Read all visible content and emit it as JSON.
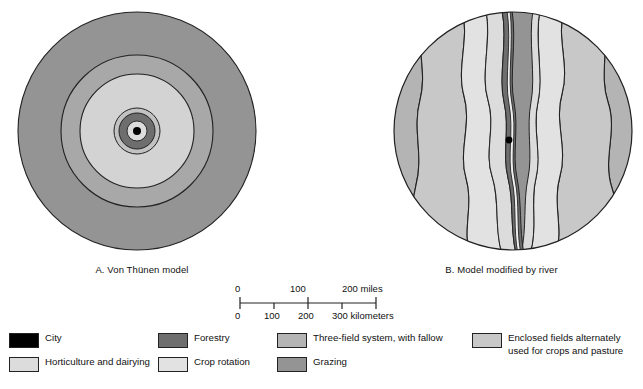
{
  "figure": {
    "panels": [
      {
        "id": "panel-a",
        "caption": "A. Von Thünen model",
        "type": "concentric-rings",
        "center": {
          "x": 137,
          "y": 131
        },
        "rings": [
          {
            "zone": "Grazing",
            "outer_r": 119,
            "color": "#949494"
          },
          {
            "zone": "Three-field system, with fallow",
            "outer_r": 76,
            "color": "#a8a8a8"
          },
          {
            "zone": "Crop rotation",
            "outer_r": 57,
            "color": "#d3d3d3"
          },
          {
            "zone": "Enclosed fields alternately used for crops and pasture",
            "outer_r": 23,
            "color": "#c2c2c2"
          },
          {
            "zone": "Forestry",
            "outer_r": 18,
            "color": "#6e6e6e"
          },
          {
            "zone": "Horticulture and dairying",
            "outer_r": 10,
            "color": "#dcdcdc"
          },
          {
            "zone": "City",
            "outer_r": 4,
            "color": "#000000"
          }
        ]
      },
      {
        "id": "panel-b",
        "caption": "B. Model modified by river",
        "type": "river-modified-bands",
        "center": {
          "x": 513,
          "y": 131
        },
        "radius": 119,
        "city_marker": {
          "x": 509,
          "y": 140,
          "r": 3.4,
          "color": "#000000"
        }
      }
    ]
  },
  "scalebar": {
    "miles": {
      "unit_label": "200 miles",
      "ticks": [
        "0",
        "100",
        "200"
      ]
    },
    "kilometers": {
      "unit_label": "300 kilometers",
      "ticks": [
        "0",
        "100",
        "200",
        "300"
      ]
    }
  },
  "legend": {
    "items": [
      {
        "label": "City",
        "color": "#000000"
      },
      {
        "label": "Horticulture and dairying",
        "color": "#dcdcdc"
      },
      {
        "label": "Forestry",
        "color": "#6e6e6e"
      },
      {
        "label": "Crop rotation",
        "color": "#e2e2e2"
      },
      {
        "label": "Three-field system, with fallow",
        "color": "#b4b4b4"
      },
      {
        "label": "Grazing",
        "color": "#949494"
      },
      {
        "label": "Enclosed fields alternately\nused for crops and pasture",
        "color": "#c8c8c8"
      }
    ]
  },
  "colors": {
    "outline": "#222222",
    "background": "#ffffff",
    "city": "#000000",
    "horticulture": "#dcdcdc",
    "forestry": "#6e6e6e",
    "crop_rotation": "#e2e2e2",
    "three_field": "#b4b4b4",
    "grazing": "#949494",
    "enclosed_fields": "#c8c8c8"
  }
}
